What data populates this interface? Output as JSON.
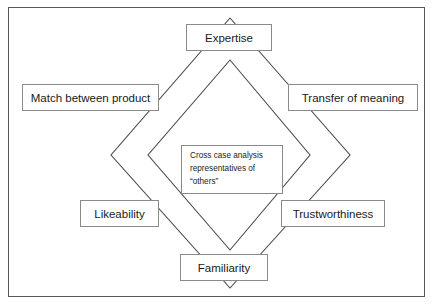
{
  "diagram": {
    "frame": {
      "border_color": "#58595b",
      "background": "#ffffff"
    },
    "stroke_color": "#4a4a4a",
    "nodes": {
      "top": "Expertise",
      "upper_left": "Match between product",
      "upper_right": "Transfer of meaning",
      "lower_left": "Likeability",
      "lower_right": "Trustworthiness",
      "bottom": "Familiarity"
    },
    "center": {
      "line1": "Cross case analysis",
      "line2": "representatives of",
      "line3": "“others”"
    },
    "shapes": {
      "outer_diamond": "diamond passing through all six attribute boxes",
      "inner_diamond": "smaller concentric diamond behind the center box"
    }
  }
}
